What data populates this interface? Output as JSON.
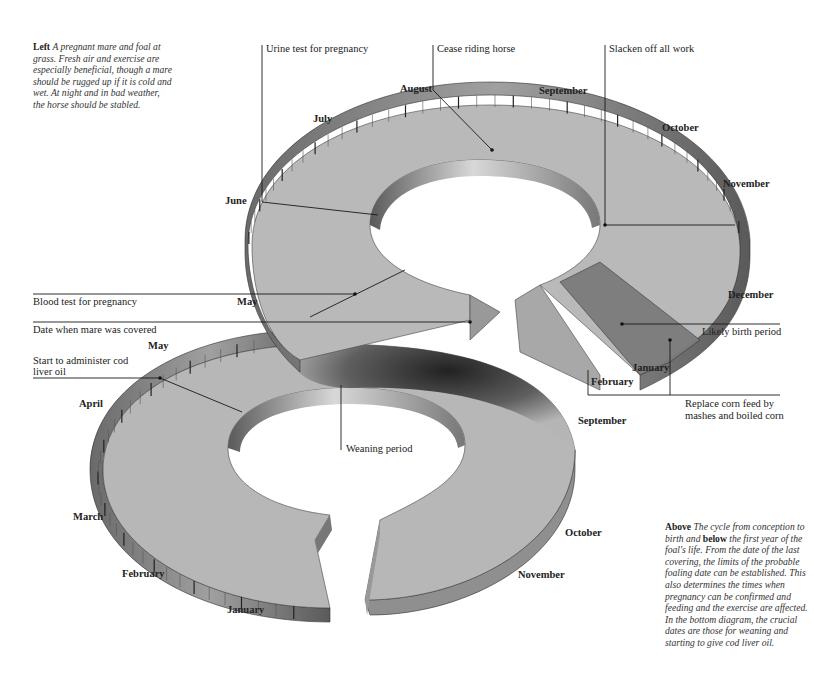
{
  "captions": {
    "left": {
      "lead": "Left",
      "text": "A pregnant mare and foal at grass. Fresh air and exercise are especially beneficial, though a mare should be rugged up if it is cold and wet. At night and in bad weather, the horse should be stabled."
    },
    "right": {
      "lead1": "Above",
      "text1": "The cycle from conception to birth and",
      "lead2": "below",
      "text2": "the first year of the foal's life. From the date of the last covering, the limits of the probable foaling date can be established. This also determines the times when pregnancy can be confirmed and feeding and the exercise are affected. In the bottom diagram, the crucial dates are those for weaning and starting to give cod liver oil."
    }
  },
  "upper_ring": {
    "title": "Pregnancy cycle",
    "months": [
      "May",
      "June",
      "July",
      "August",
      "September",
      "October",
      "November",
      "December",
      "January",
      "February"
    ],
    "annotations": [
      {
        "label": "Urine test for pregnancy"
      },
      {
        "label": "Cease riding horse"
      },
      {
        "label": "Slacken off all work"
      },
      {
        "label": "Blood test for pregnancy"
      },
      {
        "label": "Date when mare was covered"
      },
      {
        "label": "Likely birth period"
      },
      {
        "label": "Replace corn feed by",
        "label2": "mashes and boiled corn"
      }
    ]
  },
  "lower_ring": {
    "title": "Foal's first year",
    "months": [
      "May",
      "April",
      "March",
      "February",
      "January",
      "September",
      "October",
      "November"
    ],
    "annotations": [
      {
        "label": "Start to administer cod",
        "label2": "liver oil"
      },
      {
        "label": "Weaning period"
      }
    ]
  },
  "colors": {
    "face": "#b9b9b9",
    "edge": "#8d8d8d",
    "edge_dark": "#4a4a4a",
    "birth_band": "#7a7a7a",
    "line": "#1a1a1a"
  }
}
